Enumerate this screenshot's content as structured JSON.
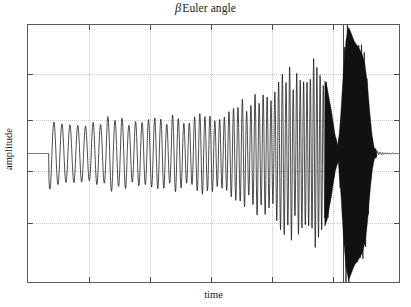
{
  "figure": {
    "title_symbol": "β",
    "title_text": "Euler angle",
    "title_full": "β Euler angle",
    "xlabel": "time",
    "ylabel": "amplitude",
    "background_color": "#ffffff",
    "frame_color": "#58595b",
    "grid_color": "#c9c9c9",
    "trace_color": "#111111"
  },
  "chart_data": {
    "type": "line",
    "xlabel": "time",
    "ylabel": "amplitude",
    "grid": true,
    "grid_style": "dotted",
    "legend": "none",
    "axis_tick_labels": "none",
    "xlim": [
      0,
      1
    ],
    "ylim": [
      -1,
      1
    ],
    "y_gridlines": [
      0.62,
      0.27,
      -0.13,
      -0.53
    ],
    "x_gridlines": [
      0.163,
      0.327,
      0.49,
      0.653,
      0.817,
      0.845
    ],
    "x_gridline_emphasis_index": 5,
    "signal": {
      "sample_count": 1400,
      "onset_x": 0.056,
      "base_frequency_hz": 46,
      "frequency_growth": 2.35,
      "envelope_points": [
        {
          "x": 0.0,
          "a": 0.0
        },
        {
          "x": 0.05,
          "a": 0.0
        },
        {
          "x": 0.057,
          "a": 0.255
        },
        {
          "x": 0.075,
          "a": 0.25
        },
        {
          "x": 0.11,
          "a": 0.232
        },
        {
          "x": 0.15,
          "a": 0.244
        },
        {
          "x": 0.19,
          "a": 0.236
        },
        {
          "x": 0.23,
          "a": 0.258
        },
        {
          "x": 0.27,
          "a": 0.249
        },
        {
          "x": 0.31,
          "a": 0.268
        },
        {
          "x": 0.35,
          "a": 0.259
        },
        {
          "x": 0.39,
          "a": 0.281
        },
        {
          "x": 0.43,
          "a": 0.274
        },
        {
          "x": 0.47,
          "a": 0.3
        },
        {
          "x": 0.51,
          "a": 0.316
        },
        {
          "x": 0.545,
          "a": 0.352
        },
        {
          "x": 0.575,
          "a": 0.4
        },
        {
          "x": 0.6,
          "a": 0.372
        },
        {
          "x": 0.62,
          "a": 0.455
        },
        {
          "x": 0.645,
          "a": 0.51
        },
        {
          "x": 0.665,
          "a": 0.43
        },
        {
          "x": 0.685,
          "a": 0.56
        },
        {
          "x": 0.705,
          "a": 0.61
        },
        {
          "x": 0.725,
          "a": 0.59
        },
        {
          "x": 0.745,
          "a": 0.655
        },
        {
          "x": 0.762,
          "a": 0.7
        },
        {
          "x": 0.778,
          "a": 0.672
        },
        {
          "x": 0.793,
          "a": 0.62
        },
        {
          "x": 0.806,
          "a": 0.52
        },
        {
          "x": 0.818,
          "a": 0.33
        },
        {
          "x": 0.828,
          "a": 0.14
        },
        {
          "x": 0.836,
          "a": 0.06
        },
        {
          "x": 0.843,
          "a": 0.3
        },
        {
          "x": 0.85,
          "a": 0.64
        },
        {
          "x": 0.857,
          "a": 0.88
        },
        {
          "x": 0.864,
          "a": 0.985
        },
        {
          "x": 0.872,
          "a": 0.93
        },
        {
          "x": 0.88,
          "a": 0.87
        },
        {
          "x": 0.89,
          "a": 0.83
        },
        {
          "x": 0.9,
          "a": 0.78
        },
        {
          "x": 0.908,
          "a": 0.7
        },
        {
          "x": 0.915,
          "a": 0.54
        },
        {
          "x": 0.921,
          "a": 0.33
        },
        {
          "x": 0.927,
          "a": 0.15
        },
        {
          "x": 0.933,
          "a": 0.045
        },
        {
          "x": 0.945,
          "a": 0.01
        },
        {
          "x": 1.0,
          "a": 0.0
        }
      ]
    }
  }
}
